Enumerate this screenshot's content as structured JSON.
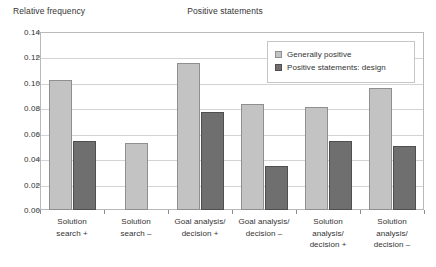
{
  "chart_data": {
    "type": "bar",
    "title": "Positive statements",
    "xlabel": "",
    "ylabel": "Relative frequency",
    "ylim": [
      0,
      0.14
    ],
    "ytick_labels": [
      "0.00",
      "0.02",
      "0.04",
      "0.06",
      "0.08",
      "0.10",
      "0.12",
      "0.14"
    ],
    "ytick_values": [
      0,
      0.02,
      0.04,
      0.06,
      0.08,
      0.1,
      0.12,
      0.14
    ],
    "grid": true,
    "legend_position": "top-right",
    "categories": [
      "Solution search +",
      "Solution search –",
      "Goal analysis/ decision +",
      "Goal analysis/ decision –",
      "Solution analysis/ decision +",
      "Solution analysis/ decision –"
    ],
    "category_lines": [
      [
        "Solution",
        "search +"
      ],
      [
        "Solution",
        "search –"
      ],
      [
        "Goal analysis/",
        "decision +"
      ],
      [
        "Goal analysis/",
        "decision –"
      ],
      [
        "Solution",
        "analysis/",
        "decision +"
      ],
      [
        "Solution",
        "analysis/",
        "decision –"
      ]
    ],
    "series": [
      {
        "name": "Generally positive",
        "color": "#c3c3c3",
        "values": [
          0.102,
          0.053,
          0.116,
          0.083,
          0.081,
          0.096
        ]
      },
      {
        "name": "Positive statements: design",
        "color": "#6f6f6f",
        "values": [
          0.054,
          null,
          0.077,
          0.035,
          0.054,
          0.05
        ]
      }
    ]
  },
  "legend": {
    "items": [
      {
        "label": "Generally positive",
        "swatch": "light"
      },
      {
        "label": "Positive statements: design",
        "swatch": "dark"
      }
    ]
  }
}
